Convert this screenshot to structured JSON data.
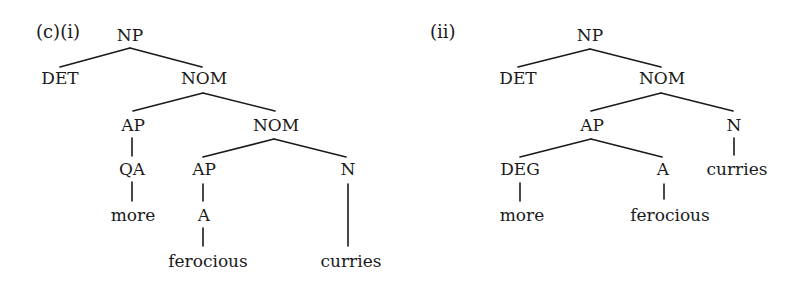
{
  "diagram": {
    "type": "syntax-tree-pair",
    "trees": [
      {
        "id": "i",
        "label": "(c)(i)",
        "nodes": {
          "np": "NP",
          "det": "DET",
          "nom1": "NOM",
          "ap1": "AP",
          "nom2": "NOM",
          "qa": "QA",
          "more": "more",
          "ap2": "AP",
          "n": "N",
          "a": "A",
          "ferocious": "ferocious",
          "curries": "curries"
        },
        "edges": [
          [
            "NP",
            "DET"
          ],
          [
            "NP",
            "NOM"
          ],
          [
            "NOM",
            "AP"
          ],
          [
            "NOM",
            "NOM"
          ],
          [
            "AP",
            "QA"
          ],
          [
            "QA",
            "more"
          ],
          [
            "NOM",
            "AP"
          ],
          [
            "NOM",
            "N"
          ],
          [
            "AP",
            "A"
          ],
          [
            "A",
            "ferocious"
          ],
          [
            "N",
            "curries"
          ]
        ]
      },
      {
        "id": "ii",
        "label": "(ii)",
        "nodes": {
          "np": "NP",
          "det": "DET",
          "nom": "NOM",
          "ap": "AP",
          "n": "N",
          "deg": "DEG",
          "a": "A",
          "more": "more",
          "ferocious": "ferocious",
          "curries": "curries"
        },
        "edges": [
          [
            "NP",
            "DET"
          ],
          [
            "NP",
            "NOM"
          ],
          [
            "NOM",
            "AP"
          ],
          [
            "NOM",
            "N"
          ],
          [
            "AP",
            "DEG"
          ],
          [
            "AP",
            "A"
          ],
          [
            "DEG",
            "more"
          ],
          [
            "A",
            "ferocious"
          ],
          [
            "N",
            "curries"
          ]
        ]
      }
    ]
  },
  "colors": {
    "ink": "#1a1a1a",
    "background": "#ffffff"
  }
}
